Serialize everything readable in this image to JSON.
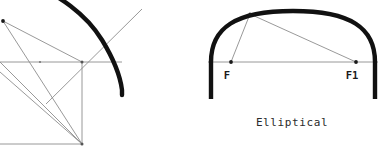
{
  "page": {
    "background_color": "#ffffff",
    "width": 388,
    "height": 153
  },
  "style": {
    "arch_stroke_color": "#111111",
    "arch_stroke_width": 4.2,
    "construction_stroke_color": "#8d8d8d",
    "construction_stroke_width": 0.9,
    "point_color": "#1a1a1a",
    "point_radius": 1.7,
    "label_color": "#1a1a1a",
    "caption_color": "#2b2b2b"
  },
  "figures": [
    {
      "id": "left-figure",
      "name": "arch-construction-partial",
      "caption": "",
      "description": "Partial arch setting-out construction: springing line, square with diagonals and a radiating ray meeting the heavy arch curve",
      "arch_curve": {
        "name": "arch-curve-heavy",
        "path": "M 30 -16 C 58 -6 86 14 102 40 C 113 58 120 74 122 90 L 122 95",
        "stroke_width": 4.4
      },
      "construction_lines": [
        {
          "name": "springing-line-horizontal",
          "x1": 0,
          "y1": 62,
          "x2": 122,
          "y2": 62
        },
        {
          "name": "square-right-side-vertical",
          "x1": 82,
          "y1": 62,
          "x2": 82,
          "y2": 144
        },
        {
          "name": "square-bottom-side",
          "x1": 0,
          "y1": 144,
          "x2": 82,
          "y2": 144
        },
        {
          "name": "diagonal-from-corner-to-upper-left-point",
          "x1": 82,
          "y1": 144,
          "x2": 3,
          "y2": 21
        },
        {
          "name": "diagonal-from-corner-to-left-edge",
          "x1": 82,
          "y1": 144,
          "x2": 0,
          "y2": 62
        },
        {
          "name": "diagonal-from-left-edge-down-right",
          "x1": 0,
          "y1": 62,
          "x2": 82,
          "y2": 144
        },
        {
          "name": "diagonal-left-bottom-to-square-corner",
          "x1": 0,
          "y1": 72,
          "x2": 82,
          "y2": 144
        },
        {
          "name": "radiating-ray-to-arch",
          "x1": 46,
          "y1": 104,
          "x2": 142,
          "y2": 9
        },
        {
          "name": "upper-left-chord",
          "x1": 3,
          "y1": 21,
          "x2": 82,
          "y2": 62
        }
      ],
      "points": [
        {
          "name": "point-upper-left",
          "x": 3,
          "y": 21,
          "label": ""
        },
        {
          "name": "point-square-top-right-corner",
          "x": 82,
          "y": 62,
          "label": ""
        },
        {
          "name": "point-square-bottom-right-corner",
          "x": 82,
          "y": 144,
          "label": ""
        },
        {
          "name": "point-springing-mid",
          "x": 40,
          "y": 62,
          "label": ""
        }
      ]
    },
    {
      "id": "right-figure",
      "name": "arch-construction-elliptical",
      "caption": "Elliptical",
      "caption_x": 292,
      "caption_y": 126,
      "description": "Elliptical arch with springing line, two foci F and F1, and focal radii drawn to a point on the curve",
      "arch_curve": {
        "name": "arch-curve-heavy",
        "path": "M 211 99 L 211 62 C 211 28 235 11 293 11 C 351 11 375 28 375 62 L 375 99",
        "stroke_width": 4.4
      },
      "construction_lines": [
        {
          "name": "springing-line-horizontal",
          "x1": 208,
          "y1": 62,
          "x2": 378,
          "y2": 62
        },
        {
          "name": "focal-radius-from-F",
          "x1": 231,
          "y1": 62,
          "x2": 250,
          "y2": 14
        },
        {
          "name": "focal-radius-from-F1",
          "x1": 356,
          "y1": 62,
          "x2": 250,
          "y2": 14
        }
      ],
      "points": [
        {
          "name": "point-focus-f",
          "x": 231,
          "y": 62,
          "label": "F",
          "label_x": 227,
          "label_y": 79
        },
        {
          "name": "point-focus-f1",
          "x": 356,
          "y": 62,
          "label": "F1",
          "label_x": 348,
          "label_y": 79
        },
        {
          "name": "point-on-curve",
          "x": 250,
          "y": 14,
          "label": ""
        }
      ]
    }
  ],
  "labels": {
    "focus_left": "F",
    "focus_right": "F1",
    "figure_caption": "Elliptical"
  }
}
